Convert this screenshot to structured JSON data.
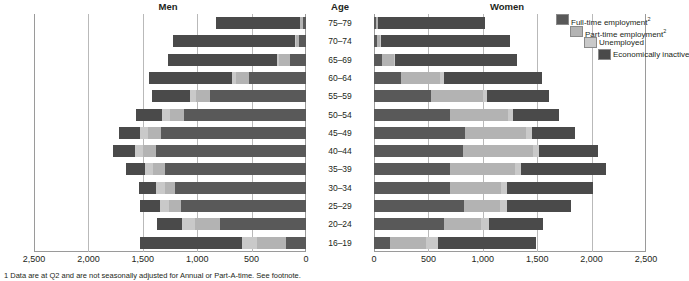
{
  "headers": {
    "men": "Men",
    "age": "Age",
    "women": "Women"
  },
  "legend": {
    "items": [
      {
        "label": "Full-time employment",
        "sup": "2",
        "color": "#595959"
      },
      {
        "label": "Part-time employment",
        "sup": "2",
        "color": "#b3b3b3"
      },
      {
        "label": "Unemployed",
        "sup": "",
        "color": "#c9c9c9"
      },
      {
        "label": "Economically inactive",
        "sup": "",
        "color": "#4a4a4a"
      }
    ]
  },
  "axis": {
    "left_ticks": [
      "2,500",
      "2,000",
      "1,500",
      "1,000",
      "500",
      "0"
    ],
    "right_ticks": [
      "0",
      "500",
      "1,000",
      "1,500",
      "2,000",
      "2,500"
    ],
    "max": 2500,
    "tick_step": 500
  },
  "footnote": {
    "text": "1  Data are at Q2 and are not seasonally adjusted for Annual or Part-A-time. See footnote.",
    "marker": "1"
  },
  "chart_data": {
    "type": "bar",
    "title": "",
    "subtitle": "",
    "xlabel": "",
    "ylabel": "Age",
    "orientation": "horizontal-pyramid",
    "grid": true,
    "legend_position": "top-right",
    "xlim": [
      0,
      2500
    ],
    "units": "thousands",
    "categories": [
      "75–79",
      "70–74",
      "65–69",
      "60–64",
      "55–59",
      "50–54",
      "45–49",
      "40–44",
      "35–39",
      "30–34",
      "25–29",
      "20–24",
      "16–19"
    ],
    "series_order": [
      "Full-time employment",
      "Part-time employment",
      "Unemployed",
      "Economically inactive"
    ],
    "panels": [
      {
        "name": "Men",
        "direction": "left",
        "series": [
          {
            "name": "Full-time employment",
            "values": [
              30,
              60,
              150,
              520,
              880,
              1120,
              1330,
              1380,
              1300,
              1200,
              1150,
              790,
              180
            ]
          },
          {
            "name": "Part-time employment",
            "values": [
              25,
              35,
              95,
              120,
              130,
              130,
              120,
              115,
              105,
              100,
              110,
              230,
              270
            ]
          },
          {
            "name": "Unemployed",
            "values": [
              5,
              10,
              25,
              45,
              55,
              70,
              75,
              80,
              75,
              75,
              85,
              120,
              140
            ]
          },
          {
            "name": "Economically inactive",
            "values": [
              770,
              1120,
              1000,
              760,
              350,
              240,
              190,
              195,
              175,
              160,
              185,
              230,
              940
            ]
          }
        ]
      },
      {
        "name": "Women",
        "direction": "right",
        "series": [
          {
            "name": "Full-time employment",
            "values": [
              15,
              25,
              70,
              250,
              520,
              700,
              840,
              820,
              700,
              700,
              830,
              640,
              150
            ]
          },
          {
            "name": "Part-time employment",
            "values": [
              20,
              30,
              110,
              360,
              480,
              530,
              560,
              640,
              600,
              470,
              330,
              340,
              330
            ]
          },
          {
            "name": "Unemployed",
            "values": [
              3,
              5,
              15,
              30,
              40,
              50,
              55,
              60,
              55,
              55,
              60,
              80,
              110
            ]
          },
          {
            "name": "Economically inactive",
            "values": [
              985,
              1190,
              1120,
              900,
              570,
              420,
              390,
              540,
              780,
              790,
              590,
              490,
              900
            ]
          }
        ]
      }
    ]
  }
}
